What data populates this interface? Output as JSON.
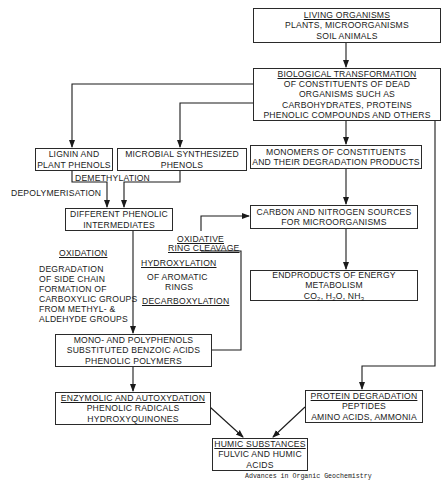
{
  "diagram": {
    "nodes": {
      "living": {
        "title": "LIVING ORGANISMS",
        "lines": [
          "PLANTS, MICROORGANISMS",
          "SOIL ANIMALS"
        ]
      },
      "bio": {
        "title": "BIOLOGICAL TRANSFORMATION",
        "lines": [
          "OF CONSTITUENTS OF DEAD",
          "ORGANISMS SUCH AS",
          "CARBOHYDRATES, PROTEINS",
          "PHENOLIC COMPOUNDS AND OTHERS"
        ]
      },
      "lignin": {
        "lines": [
          "LIGNIN AND",
          "PLANT PHENOLS"
        ]
      },
      "microbial": {
        "lines": [
          "MICROBIAL SYNTHESIZED",
          "PHENOLS"
        ]
      },
      "monomers": {
        "lines": [
          "MONOMERS OF CONSTITUENTS",
          "AND THEIR DEGRADATION PRODUCTS"
        ]
      },
      "intermediates": {
        "lines": [
          "DIFFERENT PHENOLIC",
          "INTERMEDIATES"
        ]
      },
      "carbon": {
        "lines": [
          "CARBON AND NITROGEN SOURCES",
          "FOR MICROORGANISMS"
        ]
      },
      "endproducts": {
        "lines": [
          "ENDPRODUCTS OF ENERGY",
          "METABOLISM"
        ],
        "formula": {
          "co": "CO",
          "co_sub": "2",
          "h": ", H",
          "h_sub": "2",
          "o": "O, NH",
          "nh_sub": "3"
        }
      },
      "polyphenols": {
        "lines": [
          "MONO- AND POLYPHENOLS",
          "SUBSTITUTED BENZOIC ACIDS",
          "PHENOLIC POLYMERS"
        ]
      },
      "enzymolic": {
        "title": "ENZYMOLIC AND AUTOXYDATION",
        "lines": [
          "PHENOLIC RADICALS",
          "HYDROXYQUINONES"
        ]
      },
      "protein": {
        "title": "PROTEIN DEGRADATION",
        "lines": [
          "PEPTIDES",
          "AMINO ACIDS, AMMONIA"
        ]
      },
      "humic": {
        "title": "HUMIC SUBSTANCES",
        "lines": [
          "FULVIC AND HUMIC",
          "ACIDS"
        ]
      }
    },
    "edge_labels": {
      "demethylation": "DEMETHYLATION",
      "depolymerisation": "DEPOLYMERISATION",
      "oxidative1": "OXIDATIVE",
      "oxidative2": "RING CLEAVAGE",
      "oxidation": "OXIDATION",
      "oxidation_lines": [
        "DEGRADATION",
        "OF SIDE CHAIN",
        "FORMATION OF",
        "CARBOXYLIC GROUPS",
        "FROM METHYL- &",
        "ALDEHYDE GROUPS"
      ],
      "hydroxylation": "HYDROXYLATION",
      "hydroxylation_lines": [
        "OF AROMATIC",
        "RINGS"
      ],
      "decarboxylation": "DECARBOXYLATION"
    },
    "credit": "Advances in Organic Geochemistry",
    "colors": {
      "line": "#1a1a1a",
      "background": "#ffffff"
    }
  }
}
